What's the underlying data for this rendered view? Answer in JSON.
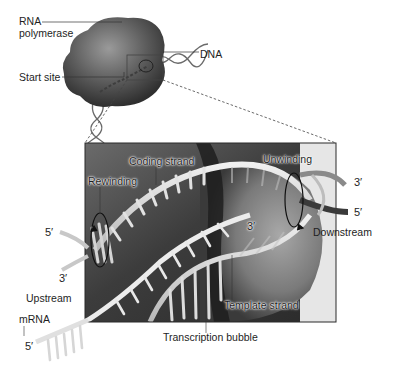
{
  "figure": {
    "overview": {
      "labels": {
        "rna_polymerase_line1": "RNA",
        "rna_polymerase_line2": "polymerase",
        "start_site": "Start site",
        "dna": "DNA"
      }
    },
    "detail_panel": {
      "labels": {
        "coding_strand": "Coding strand",
        "rewinding": "Rewinding",
        "unwinding": "Unwinding",
        "downstream": "Downstream",
        "upstream": "Upstream",
        "mrna": "mRNA",
        "template_strand": "Template strand",
        "transcription_bubble": "Transcription bubble",
        "downstream_3prime": "3′",
        "downstream_5prime": "5′",
        "upstream_5prime": "5′",
        "upstream_3prime": "3′",
        "rna_3prime_end": "3′",
        "mrna_5prime": "5′"
      }
    },
    "colors": {
      "background": "#ffffff",
      "polymerase": "#5a5a5a",
      "panel_dark": "#3a3a3a",
      "panel_light": "#9a9a9a",
      "strand": "#d9d9d9",
      "label_text": "#1e1e1e"
    }
  }
}
